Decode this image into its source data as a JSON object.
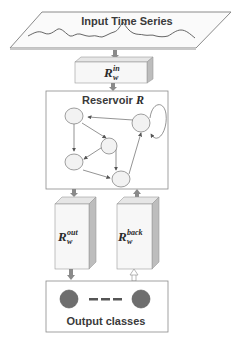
{
  "diagram": {
    "input": {
      "label": "Input Time Series"
    },
    "input_weights": {
      "symbol": "R",
      "sub": "w",
      "sup": "in"
    },
    "reservoir": {
      "label": "Reservoir ",
      "symbol": "R",
      "node_count": 5
    },
    "output_weights": {
      "symbol": "R",
      "sub": "w",
      "sup": "out"
    },
    "feedback_weights": {
      "symbol": "R",
      "sub": "w",
      "sup": "back"
    },
    "output": {
      "label": "Output classes",
      "separator": "- - -"
    },
    "colors": {
      "box_fill": "#f7f7f7",
      "box_side": "#bdbdbd",
      "arrow": "#8a8a8a",
      "output_node": "#6e6e6e",
      "reservoir_node": "#f2f2f2",
      "stroke": "#7a7a7a"
    }
  }
}
